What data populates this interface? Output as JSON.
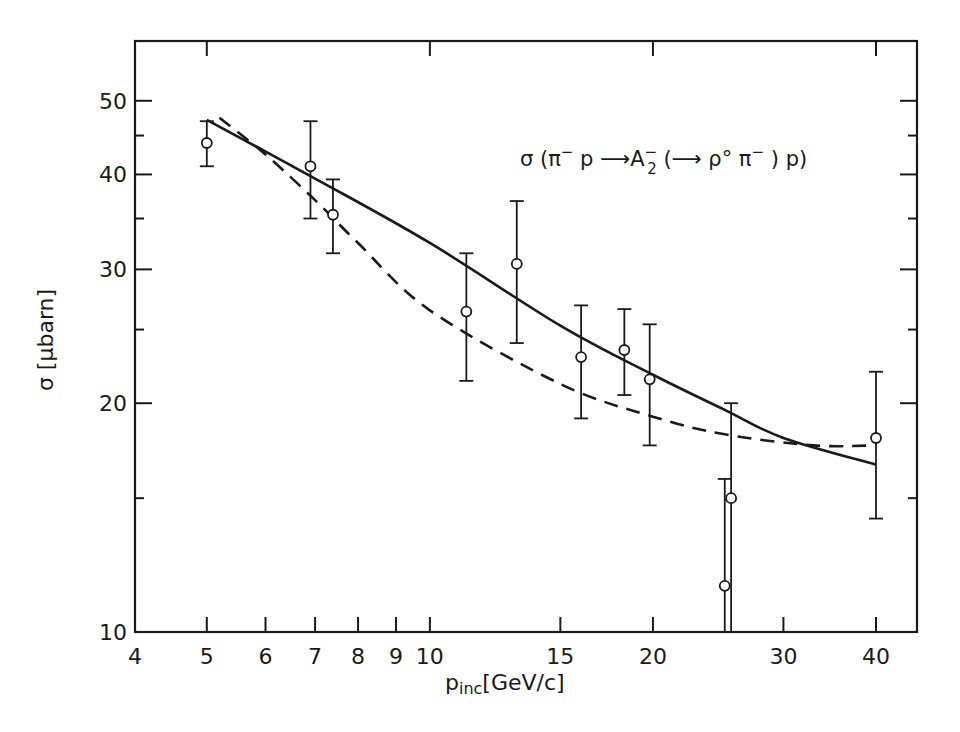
{
  "chart_data": {
    "type": "scatter",
    "xlabel": "p_inc [GeV/c]",
    "ylabel": "σ [μbarn]",
    "xscale": "log",
    "yscale": "log",
    "xlim": [
      4,
      45
    ],
    "ylim": [
      10,
      60
    ],
    "grid": false,
    "legend": null,
    "x_ticks": [
      4,
      5,
      6,
      7,
      8,
      9,
      10,
      15,
      20,
      30,
      40
    ],
    "x_tick_labels": [
      "4",
      "5",
      "6",
      "7",
      "8",
      "9",
      "10",
      "15",
      "20",
      "30",
      "40"
    ],
    "y_ticks": [
      10,
      20,
      30,
      40,
      50
    ],
    "y_tick_labels": [
      "10",
      "20",
      "30",
      "40",
      "50"
    ],
    "y_minor_ticks": [
      15,
      25,
      35,
      45
    ],
    "series": [
      {
        "name": "data",
        "style": "open-circle-errorbars",
        "x": [
          5.0,
          6.9,
          7.4,
          11.2,
          13.1,
          16.0,
          18.3,
          19.8,
          25.0,
          25.5,
          40.0
        ],
        "y": [
          44.0,
          41.0,
          35.4,
          26.4,
          30.5,
          23.0,
          23.5,
          21.5,
          11.5,
          15.0,
          18.0
        ],
        "y_err_high": [
          47.0,
          47.0,
          39.4,
          31.5,
          36.9,
          26.9,
          26.6,
          25.4,
          15.9,
          20.0,
          22.0
        ],
        "y_err_low": [
          41.0,
          35.0,
          31.5,
          21.4,
          24.0,
          19.1,
          20.5,
          17.6,
          10.0,
          10.0,
          14.1
        ]
      },
      {
        "name": "fit-solid",
        "style": "solid-line",
        "x": [
          5,
          7,
          10,
          15,
          20,
          25,
          30,
          40
        ],
        "y": [
          47.2,
          39.5,
          32.5,
          25.3,
          21.8,
          19.6,
          18.0,
          16.6
        ]
      },
      {
        "name": "fit-dashed",
        "style": "dashed-line",
        "x": [
          5.2,
          6,
          7,
          8,
          10,
          15,
          20,
          25,
          33,
          40
        ],
        "y": [
          47.5,
          42.5,
          37.0,
          32.5,
          26.5,
          21.2,
          19.2,
          18.2,
          17.6,
          17.6
        ]
      }
    ],
    "annotations": [
      {
        "text": "σ (π⁻p → A₂⁻(→ρ°π⁻) p)",
        "position": "upper-right"
      }
    ]
  },
  "labels": {
    "annotation": "σ (π",
    "annotation_sup1": "−",
    "annotation_mid1": " p ",
    "annotation_arrow": "⟶",
    "annotation_A": "A",
    "annotation_A_sup": "−",
    "annotation_A_sub": "2",
    "annotation_mid2": " (",
    "annotation_arrow2": "⟶",
    "annotation_mid3": " ρ° π",
    "annotation_sup2": "−",
    "annotation_end": " ) p)",
    "ylabel": "σ [μbarn]",
    "xlabel_main": "p",
    "xlabel_sub": "inc",
    "xlabel_unit": "[GeV/c]"
  }
}
